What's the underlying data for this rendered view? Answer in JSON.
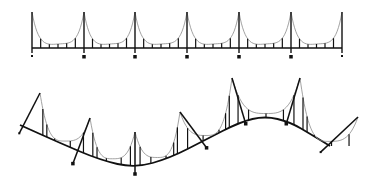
{
  "illustration": {
    "subject": "suspension bridge line art",
    "background": "#ffffff",
    "stroke_dark": "#111111",
    "stroke_cable": "#8a8a8a",
    "straight_bridge": {
      "towers_x": [
        32,
        84,
        135,
        187,
        239,
        291,
        342
      ],
      "tower_top_y": 12,
      "deck_y": 48,
      "cable_low_y": 44,
      "hangers_per_span": 5,
      "foot_y": 55
    },
    "curved_bridge": {
      "deck_points": [
        [
          20,
          125
        ],
        [
          60,
          143
        ],
        [
          100,
          160
        ],
        [
          135,
          168
        ],
        [
          170,
          158
        ],
        [
          205,
          140
        ],
        [
          240,
          122
        ],
        [
          265,
          116
        ],
        [
          290,
          122
        ],
        [
          312,
          135
        ],
        [
          330,
          146
        ]
      ],
      "towers": [
        {
          "base": [
            22,
            128
          ],
          "top": [
            40,
            93
          ]
        },
        {
          "base": [
            75,
            158
          ],
          "top": [
            90,
            118
          ]
        },
        {
          "base": [
            135,
            168
          ],
          "top": [
            135,
            132
          ]
        },
        {
          "base": [
            203,
            143
          ],
          "top": [
            180,
            112
          ]
        },
        {
          "base": [
            244,
            118
          ],
          "top": [
            232,
            78
          ]
        },
        {
          "base": [
            288,
            118
          ],
          "top": [
            300,
            78
          ]
        },
        {
          "base": [
            325,
            148
          ],
          "top": [
            358,
            117
          ]
        }
      ]
    }
  }
}
